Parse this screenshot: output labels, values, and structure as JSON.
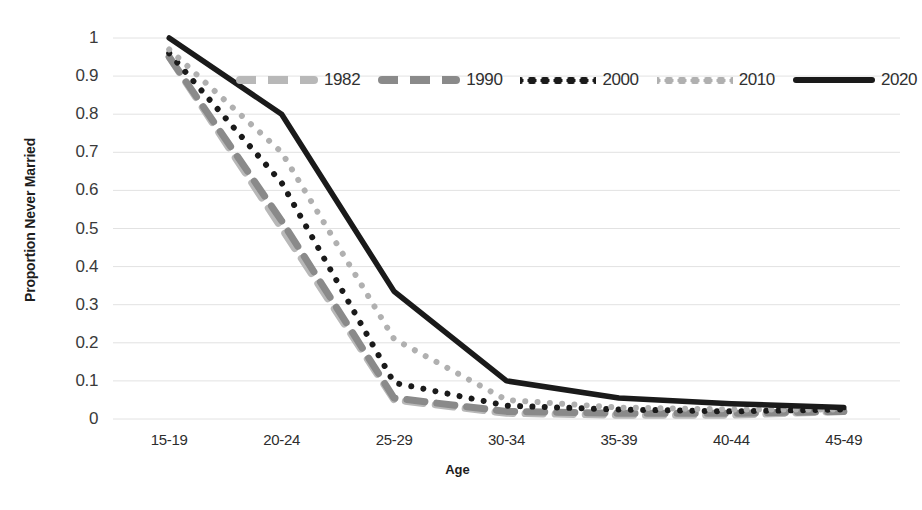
{
  "chart_data": {
    "type": "line",
    "title": "",
    "xlabel": "Age",
    "ylabel": "Proportion Never Married",
    "categories": [
      "15-19",
      "20-24",
      "25-29",
      "30-34",
      "35-39",
      "40-44",
      "45-49"
    ],
    "ylim": [
      0,
      1
    ],
    "y_ticks": [
      "0",
      "0.1",
      "0.2",
      "0.3",
      "0.4",
      "0.5",
      "0.6",
      "0.7",
      "0.8",
      "0.9",
      "1"
    ],
    "grid": true,
    "legend_position": "top-center-inside",
    "series": [
      {
        "name": "1982",
        "values": [
          0.95,
          0.5,
          0.05,
          0.015,
          0.01,
          0.01,
          0.02
        ],
        "style": "dashed",
        "color": "#b8b8b8",
        "swatch": "dashed-light"
      },
      {
        "name": "1990",
        "values": [
          0.95,
          0.52,
          0.055,
          0.02,
          0.015,
          0.015,
          0.02
        ],
        "style": "dashed",
        "color": "#8a8a8a",
        "swatch": "dashed-medium"
      },
      {
        "name": "2000",
        "values": [
          0.96,
          0.62,
          0.095,
          0.035,
          0.025,
          0.02,
          0.025
        ],
        "style": "dotted",
        "color": "#1a1a1a",
        "swatch": "dotted-dark"
      },
      {
        "name": "2010",
        "values": [
          0.97,
          0.7,
          0.21,
          0.05,
          0.03,
          0.025,
          0.025
        ],
        "style": "dotted",
        "color": "#b0b0b0",
        "swatch": "dotted-light"
      },
      {
        "name": "2020",
        "values": [
          1.0,
          0.8,
          0.335,
          0.1,
          0.055,
          0.04,
          0.03
        ],
        "style": "solid",
        "color": "#1a1a1a",
        "swatch": "solid-dark"
      }
    ]
  },
  "axes": {
    "y_title": "Proportion Never Married",
    "x_title": "Age"
  }
}
